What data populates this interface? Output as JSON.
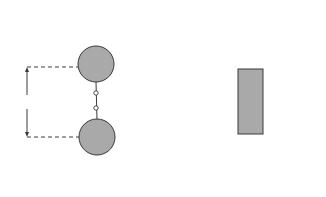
{
  "figure": {
    "left": {
      "name": "electric dipole field",
      "positive_charge_sign": "+",
      "negative_charge_sign": "−",
      "point_labels": [
        "A",
        "B"
      ],
      "dimension_label": "l",
      "sphere_color": "#a9a9a9"
    },
    "right": {
      "name": "bar magnet field",
      "pole_labels": {
        "north": "N",
        "south": "S"
      },
      "magnet_color": "#a9a9a9"
    },
    "line_color": "#3a3a3a"
  }
}
